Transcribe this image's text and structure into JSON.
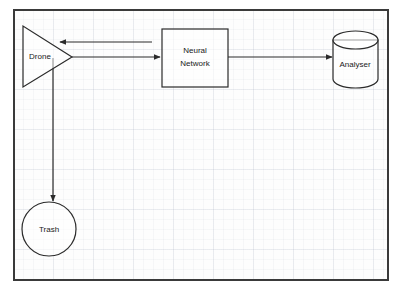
{
  "diagram": {
    "frame": {
      "border_color": "#3a3a3a",
      "background_color": "#fdfdfd",
      "grid_color": "#96a0b4"
    },
    "nodes": [
      {
        "id": "drone",
        "label": "Drone",
        "shape": "triangle",
        "x": 23,
        "y": 26,
        "width": 49,
        "height": 61,
        "label_x": 40,
        "label_y": 57
      },
      {
        "id": "neural-network",
        "label": "Neural Network",
        "label_line1": "Neural",
        "label_line2": "Network",
        "shape": "rectangle",
        "x": 162,
        "y": 29,
        "width": 66,
        "height": 58,
        "label_x": 195,
        "label_y": 58
      },
      {
        "id": "analyser",
        "label": "Analyser",
        "shape": "cylinder",
        "x": 333,
        "y": 31,
        "width": 45,
        "height": 57,
        "label_x": 355,
        "label_y": 65
      },
      {
        "id": "trash",
        "label": "Trash",
        "shape": "circle",
        "cx": 49,
        "cy": 229,
        "r": 27,
        "label_x": 49,
        "label_y": 229
      }
    ],
    "edges": [
      {
        "id": "drone-to-neural-network",
        "from": "drone",
        "to": "neural-network",
        "label": "",
        "direction": "right",
        "points": "72,57 158,57"
      },
      {
        "id": "neural-network-to-drone",
        "from": "neural-network",
        "to": "drone",
        "label": "",
        "direction": "left",
        "points": "152,42 58,42"
      },
      {
        "id": "neural-network-to-analyser",
        "from": "neural-network",
        "to": "analyser",
        "label": "",
        "direction": "right",
        "points": "228,57 330,57"
      },
      {
        "id": "drone-to-trash",
        "from": "drone",
        "to": "trash",
        "label": "",
        "direction": "down",
        "points": "53,58 53,199"
      }
    ]
  }
}
